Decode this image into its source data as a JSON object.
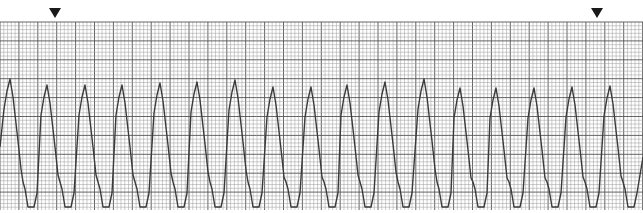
{
  "strip": {
    "type": "rhythm-strip",
    "paper": {
      "background": "#ffffff",
      "minor_line_color": "#9a9a9a",
      "major_line_color": "#555555",
      "minor_spacing_px": 3.78,
      "major_every": 5,
      "top": 22,
      "bottom": 210
    },
    "trace": {
      "color": "#3a3a3a",
      "baseline_y": 207,
      "complexes": [
        {
          "peak_x": 10,
          "peak_y": 79
        },
        {
          "peak_x": 47,
          "peak_y": 85
        },
        {
          "peak_x": 85,
          "peak_y": 85
        },
        {
          "peak_x": 122,
          "peak_y": 85
        },
        {
          "peak_x": 160,
          "peak_y": 83
        },
        {
          "peak_x": 197,
          "peak_y": 82
        },
        {
          "peak_x": 235,
          "peak_y": 80
        },
        {
          "peak_x": 273,
          "peak_y": 87
        },
        {
          "peak_x": 311,
          "peak_y": 87
        },
        {
          "peak_x": 347,
          "peak_y": 85
        },
        {
          "peak_x": 385,
          "peak_y": 82
        },
        {
          "peak_x": 424,
          "peak_y": 79
        },
        {
          "peak_x": 460,
          "peak_y": 88
        },
        {
          "peak_x": 496,
          "peak_y": 88
        },
        {
          "peak_x": 534,
          "peak_y": 88
        },
        {
          "peak_x": 572,
          "peak_y": 87
        },
        {
          "peak_x": 610,
          "peak_y": 86
        }
      ]
    },
    "markers": [
      {
        "name": "start-marker",
        "x": 55,
        "symbol": "down-triangle-icon"
      },
      {
        "name": "end-marker",
        "x": 597,
        "symbol": "down-triangle-icon"
      }
    ]
  }
}
